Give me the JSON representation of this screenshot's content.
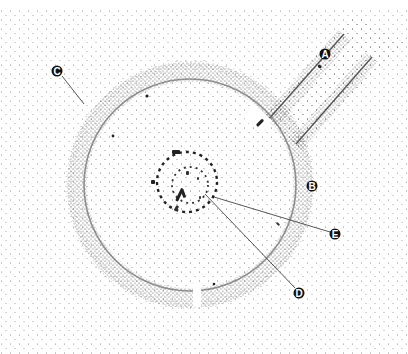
{
  "diagram": {
    "type": "stippled archaeological plan",
    "colors": {
      "background": "#ffffff",
      "stipple": "#3a3a3a",
      "label_fill": "#111111",
      "label_text": "#ffffff",
      "leader_line": "#444444"
    },
    "labels": [
      {
        "id": "A",
        "text": "A",
        "x": 325,
        "y": 54,
        "points_to": "avenue"
      },
      {
        "id": "B",
        "text": "B",
        "x": 312,
        "y": 186,
        "points_to": "outer bank"
      },
      {
        "id": "C",
        "text": "C",
        "x": 57,
        "y": 71,
        "points_to": "ditch / enclosure edge",
        "leader_to": [
          84,
          104
        ]
      },
      {
        "id": "D",
        "text": "D",
        "x": 299,
        "y": 293,
        "points_to": "inner stone circle",
        "leader_to": [
          208,
          194
        ]
      },
      {
        "id": "E",
        "text": "E",
        "x": 335,
        "y": 234,
        "points_to": "central stone setting",
        "leader_to": [
          218,
          198
        ]
      }
    ]
  }
}
